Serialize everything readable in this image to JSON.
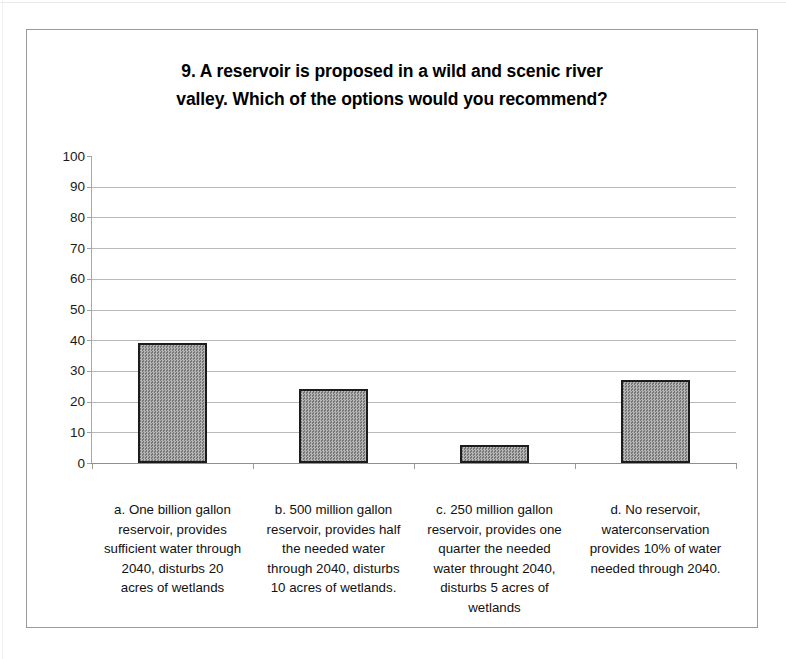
{
  "chart_data": {
    "type": "bar",
    "title_lines": [
      "9. A reservoir is proposed in a wild and scenic river",
      "valley.  Which of the options would you recommend?"
    ],
    "categories": [
      "a. One billion gallon reservoir, provides sufficient water through 2040, disturbs 20 acres  of wetlands",
      "b. 500 million gallon reservoir, provides half the needed water through 2040, disturbs 10 acres of wetlands.",
      "c. 250 million gallon reservoir, provides one quarter the needed water throught 2040, disturbs 5 acres of wetlands",
      "d. No reservoir, waterconservation provides 10% of water needed through 2040."
    ],
    "category_lines": [
      [
        "a. One billion gallon",
        "reservoir, provides",
        "sufficient water through",
        "2040, disturbs 20",
        "acres  of wetlands"
      ],
      [
        "b. 500 million gallon",
        "reservoir, provides half",
        "the needed water",
        "through 2040, disturbs",
        "10 acres of wetlands."
      ],
      [
        "c. 250 million gallon",
        "reservoir, provides one",
        "quarter the needed",
        "water throught 2040,",
        "disturbs 5 acres of",
        "wetlands"
      ],
      [
        "d. No reservoir,",
        "waterconservation",
        "provides 10% of water",
        "needed through 2040."
      ]
    ],
    "values": [
      39,
      24,
      6,
      27
    ],
    "xlabel": "",
    "ylabel": "",
    "ylim": [
      0,
      100
    ],
    "ytick_step": 10,
    "yticks": [
      100,
      90,
      80,
      70,
      60,
      50,
      40,
      30,
      20,
      10,
      0
    ],
    "ytick_labels": [
      "100",
      "90",
      "80",
      "70",
      "60",
      "50",
      "40",
      "30",
      "20",
      "10",
      "0"
    ],
    "grid": true,
    "legend": false,
    "bar_fill_color": "#a8a8a8",
    "bar_border_color": "#1c1c1c",
    "gridline_color": "#b9b9b9",
    "axis_color": "#8f8f8f",
    "plot_background": "#ffffff",
    "frame_border_color": "#9a9a9a"
  }
}
